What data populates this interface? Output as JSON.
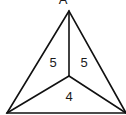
{
  "diagram": {
    "type": "triangle-partition",
    "vertices": {
      "top": [
        69,
        11
      ],
      "bottom_left": [
        7,
        113
      ],
      "bottom_right": [
        126,
        113
      ],
      "interior": [
        69,
        76
      ]
    },
    "regions": [
      {
        "name": "left",
        "label": "5",
        "pos": [
          53,
          67
        ]
      },
      {
        "name": "right",
        "label": "5",
        "pos": [
          84,
          67
        ]
      },
      {
        "name": "bottom",
        "label": "4",
        "pos": [
          69,
          101
        ]
      }
    ],
    "top_glyph": "A"
  }
}
